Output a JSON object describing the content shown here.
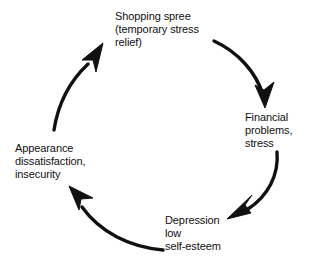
{
  "diagram": {
    "type": "cycle",
    "background_color": "#ffffff",
    "stroke_color": "#111111",
    "text_color": "#111111",
    "nodes": [
      {
        "id": "shopping-spree",
        "position": "top",
        "label": "Shopping spree\n(temporary stress\nrelief)",
        "lines": [
          "Shopping spree",
          "(temporary stress",
          "relief)"
        ]
      },
      {
        "id": "financial-problems",
        "position": "right",
        "label": "Financial\nproblems,\nstress",
        "lines": [
          "Financial",
          "problems,",
          "stress"
        ]
      },
      {
        "id": "depression-low-self-esteem",
        "position": "bottom",
        "label": "Depression\nlow\nself-esteem",
        "lines": [
          "Depression",
          "low",
          "self-esteem"
        ]
      },
      {
        "id": "appearance-dissatisfaction",
        "position": "left",
        "label": "Appearance\ndissatisfaction,\ninsecurity",
        "lines": [
          "Appearance",
          "dissatisfaction,",
          "insecurity"
        ]
      }
    ],
    "arrows": [
      {
        "id": "arrow-shopping-to-financial",
        "from": "shopping-spree",
        "to": "financial-problems",
        "direction": "clockwise"
      },
      {
        "id": "arrow-financial-to-depression",
        "from": "financial-problems",
        "to": "depression-low-self-esteem",
        "direction": "clockwise"
      },
      {
        "id": "arrow-depression-to-appearance",
        "from": "depression-low-self-esteem",
        "to": "appearance-dissatisfaction",
        "direction": "clockwise"
      },
      {
        "id": "arrow-appearance-to-shopping",
        "from": "appearance-dissatisfaction",
        "to": "shopping-spree",
        "direction": "clockwise"
      }
    ]
  }
}
